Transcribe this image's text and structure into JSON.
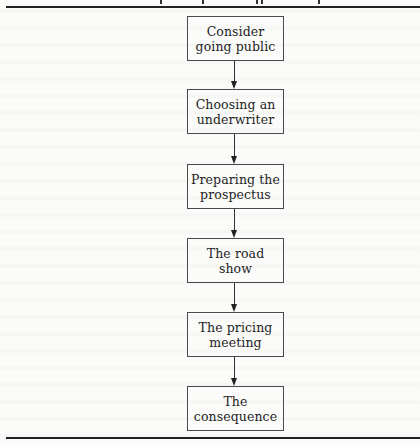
{
  "diagram": {
    "type": "flowchart",
    "direction": "top-to-bottom",
    "header_text_visible": false,
    "steps": [
      {
        "label": "Consider\ngoing public",
        "top": 16
      },
      {
        "label": "Choosing an\nunderwriter",
        "top": 89
      },
      {
        "label": "Preparing the\nprospectus",
        "top": 164
      },
      {
        "label": "The road\nshow",
        "top": 238
      },
      {
        "label": "The pricing\nmeeting",
        "top": 312
      },
      {
        "label": "The\nconsequence",
        "top": 386
      }
    ],
    "edges": [
      {
        "from": 0,
        "to": 1
      },
      {
        "from": 1,
        "to": 2
      },
      {
        "from": 2,
        "to": 3
      },
      {
        "from": 3,
        "to": 4
      },
      {
        "from": 4,
        "to": 5
      }
    ]
  },
  "colors": {
    "background": "#fbfbfa",
    "border": "#4a4a4a",
    "text": "#1e1e1e",
    "rule": "#222222"
  }
}
